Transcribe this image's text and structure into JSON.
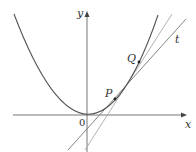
{
  "figure": {
    "type": "parabola tangent and secant diagram",
    "labels": {
      "y_axis": "y",
      "x_axis": "x",
      "origin": "0",
      "point_p": "P",
      "point_q": "Q",
      "tangent": "t"
    },
    "colors": {
      "curve": "#555555",
      "axes": "#666666",
      "tangent": "#777777",
      "secant": "#aaaaaa",
      "points": "#222222"
    }
  }
}
